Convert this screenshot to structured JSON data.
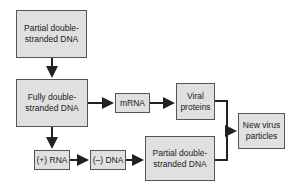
{
  "diagram": {
    "nodes": [
      {
        "id": "partial_ds_dna_top",
        "label": "Partial double-stranded DNA"
      },
      {
        "id": "fully_ds_dna",
        "label": "Fully double-stranded DNA"
      },
      {
        "id": "mrna",
        "label": "mRNA"
      },
      {
        "id": "viral_proteins",
        "label": "Viral proteins"
      },
      {
        "id": "plus_rna",
        "label": "(+) RNA"
      },
      {
        "id": "minus_dna",
        "label": "(–) DNA"
      },
      {
        "id": "partial_ds_dna_bottom",
        "label": "Partial double-stranded DNA"
      },
      {
        "id": "new_virus_particles",
        "label": "New virus particles"
      }
    ],
    "edges": [
      {
        "from": "partial_ds_dna_top",
        "to": "fully_ds_dna"
      },
      {
        "from": "fully_ds_dna",
        "to": "mrna"
      },
      {
        "from": "mrna",
        "to": "viral_proteins"
      },
      {
        "from": "fully_ds_dna",
        "to": "plus_rna"
      },
      {
        "from": "plus_rna",
        "to": "minus_dna"
      },
      {
        "from": "minus_dna",
        "to": "partial_ds_dna_bottom"
      },
      {
        "from": "viral_proteins",
        "to": "new_virus_particles"
      },
      {
        "from": "partial_ds_dna_bottom",
        "to": "new_virus_particles"
      }
    ],
    "colors": {
      "box_fill": "#e0e0e0",
      "box_border": "#555555",
      "arrow": "#222222"
    }
  }
}
